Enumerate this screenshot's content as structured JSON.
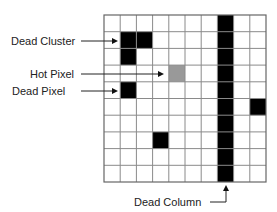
{
  "grid": {
    "rows": 10,
    "cols": 10,
    "left": 104,
    "top": 15,
    "width": 162,
    "height": 167,
    "line_color": "#8a8a8a",
    "border_color": "#666666",
    "dead_color": "#000000",
    "hot_color": "#999999",
    "cells": [
      {
        "row": 1,
        "col": 1,
        "type": "dead"
      },
      {
        "row": 1,
        "col": 2,
        "type": "dead"
      },
      {
        "row": 2,
        "col": 1,
        "type": "dead"
      },
      {
        "row": 3,
        "col": 4,
        "type": "hot"
      },
      {
        "row": 4,
        "col": 1,
        "type": "dead"
      },
      {
        "row": 5,
        "col": 9,
        "type": "dead"
      },
      {
        "row": 7,
        "col": 3,
        "type": "dead"
      }
    ],
    "dead_column": 7
  },
  "labels": {
    "dead_cluster": "Dead Cluster",
    "hot_pixel": "Hot Pixel",
    "dead_pixel": "Dead Pixel",
    "dead_column": "Dead Column"
  }
}
